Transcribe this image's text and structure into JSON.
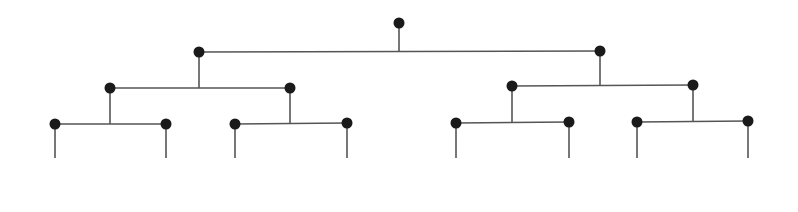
{
  "diagram": {
    "type": "binary-tree",
    "colors": {
      "line": "#555555",
      "node": "#1a1a1a",
      "background": "#ffffff"
    },
    "node_radius": 5.5,
    "line_width": 1.6,
    "leaf_stem_bottom": 158,
    "nodes": [
      {
        "id": "root",
        "x": 399,
        "y": 23
      },
      {
        "id": "L",
        "x": 199,
        "y": 52
      },
      {
        "id": "R",
        "x": 600,
        "y": 51
      },
      {
        "id": "LL",
        "x": 110,
        "y": 88
      },
      {
        "id": "LR",
        "x": 290,
        "y": 88
      },
      {
        "id": "RL",
        "x": 512,
        "y": 86
      },
      {
        "id": "RR",
        "x": 693,
        "y": 85
      },
      {
        "id": "LLL",
        "x": 55,
        "y": 124
      },
      {
        "id": "LLR",
        "x": 166,
        "y": 124
      },
      {
        "id": "LRL",
        "x": 235,
        "y": 124
      },
      {
        "id": "LRR",
        "x": 347,
        "y": 123
      },
      {
        "id": "RLL",
        "x": 456,
        "y": 123
      },
      {
        "id": "RLR",
        "x": 569,
        "y": 122
      },
      {
        "id": "RRL",
        "x": 637,
        "y": 122
      },
      {
        "id": "RRR",
        "x": 748,
        "y": 121
      }
    ],
    "edges": [
      {
        "parent": "root",
        "children": [
          "L",
          "R"
        ]
      },
      {
        "parent": "L",
        "children": [
          "LL",
          "LR"
        ]
      },
      {
        "parent": "R",
        "children": [
          "RL",
          "RR"
        ]
      },
      {
        "parent": "LL",
        "children": [
          "LLL",
          "LLR"
        ]
      },
      {
        "parent": "LR",
        "children": [
          "LRL",
          "LRR"
        ]
      },
      {
        "parent": "RL",
        "children": [
          "RLL",
          "RLR"
        ]
      },
      {
        "parent": "RR",
        "children": [
          "RRL",
          "RRR"
        ]
      }
    ],
    "leaves": [
      "LLL",
      "LLR",
      "LRL",
      "LRR",
      "RLL",
      "RLR",
      "RRL",
      "RRR"
    ]
  }
}
